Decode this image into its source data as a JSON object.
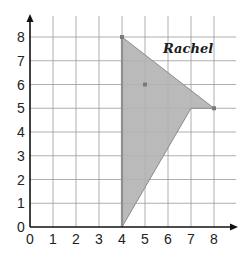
{
  "diagram": {
    "type": "coordinate-grid-polygon",
    "signature": "Rachel",
    "x_axis": {
      "ticks": [
        "0",
        "1",
        "2",
        "3",
        "4",
        "5",
        "6",
        "7",
        "8"
      ],
      "range": [
        0,
        8
      ]
    },
    "y_axis": {
      "ticks": [
        "0",
        "1",
        "2",
        "3",
        "4",
        "5",
        "6",
        "7",
        "8"
      ],
      "range": [
        0,
        8
      ]
    },
    "polygon": {
      "vertices": [
        [
          4,
          8
        ],
        [
          8,
          5
        ],
        [
          7,
          5
        ],
        [
          4,
          0
        ]
      ],
      "fill": "#b3b3b3",
      "stroke": "#8a8a8a"
    },
    "points": [
      [
        4,
        8
      ],
      [
        8,
        5
      ],
      [
        5,
        6
      ]
    ],
    "colors": {
      "grid": "#9a9a9a",
      "axis": "#111111",
      "background": "#ffffff"
    }
  }
}
